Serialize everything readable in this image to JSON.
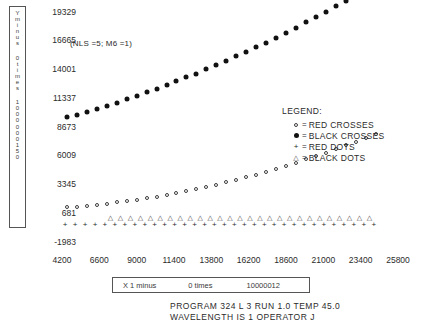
{
  "chart_data": {
    "type": "scatter",
    "title": "",
    "annotation": "(NLS =5; M6 =1)",
    "xlabel": "X 1 minus     0 times     10000012",
    "ylabel": "Y minus 0 times 1000000150",
    "xlim": [
      4200,
      25800
    ],
    "ylim": [
      -1983,
      19329
    ],
    "grid": false,
    "legend_position": "right-middle",
    "xticks": [
      4200,
      6600,
      9000,
      11400,
      13800,
      16200,
      18600,
      21000,
      23400,
      25800
    ],
    "yticks": [
      19329,
      16665,
      14001,
      11337,
      8673,
      6009,
      3345,
      681,
      -1983
    ],
    "series": [
      {
        "name": "BLACK CROSSES",
        "marker": "filled-circle",
        "color": "#111111",
        "x": [
          4520,
          5160,
          5800,
          6440,
          7080,
          7720,
          8360,
          9000,
          9640,
          10280,
          10920,
          11560,
          12200,
          12840,
          13480,
          14120,
          14760,
          15400,
          16040,
          16680,
          17320,
          17960,
          18600,
          19240,
          19880,
          20520,
          21160,
          21800,
          22440,
          23080,
          23720,
          24360
        ],
        "y": [
          9560,
          9820,
          10090,
          10360,
          10650,
          10940,
          11240,
          11560,
          11880,
          12210,
          12550,
          12900,
          13260,
          13630,
          14010,
          14400,
          14800,
          15210,
          15630,
          16060,
          16500,
          16950,
          17410,
          17880,
          18360,
          18850,
          19350,
          19860,
          20380,
          20910,
          21450,
          22000
        ]
      },
      {
        "name": "RED CROSSES",
        "marker": "open-circle",
        "color": "#3d3d3d",
        "x": [
          4520,
          5160,
          5800,
          6440,
          7080,
          7720,
          8360,
          9000,
          9640,
          10280,
          10920,
          11560,
          12200,
          12840,
          13480,
          14120,
          14760,
          15400,
          16040,
          16680,
          17320,
          17960,
          18600,
          19240,
          19880,
          20520,
          21160,
          21800,
          22440,
          23080,
          23720,
          24360
        ],
        "y": [
          1230,
          1300,
          1380,
          1470,
          1570,
          1680,
          1800,
          1930,
          2070,
          2220,
          2380,
          2550,
          2730,
          2920,
          3120,
          3330,
          3550,
          3780,
          4020,
          4270,
          4530,
          4800,
          5080,
          5370,
          5670,
          5980,
          6300,
          6630,
          6970,
          7320,
          7680,
          8050
        ]
      },
      {
        "name": "RED DOTS",
        "marker": "plus",
        "color": "#2b2b2b",
        "x": [
          4400,
          5040,
          5680,
          6320,
          6960,
          7600,
          8240,
          8880,
          9520,
          10160,
          10800,
          11440,
          12080,
          12720,
          13360,
          14000,
          14640,
          15280,
          15920,
          16560,
          17200,
          17840,
          18480,
          19120,
          19760,
          20400,
          21040,
          21680,
          22320,
          22960,
          23600,
          24240
        ],
        "y": [
          -430,
          -430,
          -430,
          -430,
          -430,
          -430,
          -430,
          -430,
          -430,
          -430,
          -430,
          -430,
          -430,
          -430,
          -430,
          -430,
          -430,
          -430,
          -430,
          -430,
          -430,
          -430,
          -430,
          -430,
          -430,
          -430,
          -430,
          -430,
          -430,
          -430,
          -430,
          -430
        ]
      },
      {
        "name": "BLACK DOTS",
        "marker": "triangle",
        "color": "#3d3d3d",
        "x": [
          7320,
          7960,
          8600,
          9240,
          9880,
          10520,
          11160,
          11800,
          12440,
          13080,
          13720,
          14360,
          15000,
          15640,
          16280,
          16920,
          17560,
          18200,
          18840,
          19480,
          20120,
          20760,
          21400,
          22040,
          22680,
          23320,
          23960
        ],
        "y": [
          280,
          280,
          280,
          280,
          280,
          280,
          280,
          280,
          280,
          280,
          280,
          280,
          280,
          280,
          280,
          280,
          280,
          280,
          280,
          280,
          280,
          280,
          280,
          280,
          280,
          280,
          280
        ]
      }
    ]
  },
  "y_caption": {
    "line1": "Y\nm\ni\nn\nu\ns",
    "line2": "0\nt\ni\nm\ne\ns",
    "line3": "1\n0\n0\n0\n0\n0\n0\n1\n5\n0"
  },
  "x_caption": {
    "part1": "X 1 minus",
    "part2": "0 times",
    "part3": "10000012"
  },
  "legend": {
    "title": "LEGEND:",
    "equals": "=",
    "items": [
      {
        "symbol": "open-circle",
        "label": "RED CROSSES"
      },
      {
        "symbol": "filled-circle",
        "label": "BLACK CROSSES"
      },
      {
        "symbol": "plus",
        "label": "RED DOTS"
      },
      {
        "symbol": "triangle",
        "label": "BLACK DOTS"
      }
    ]
  },
  "footer": {
    "line1": "PROGRAM 324 L 3 RUN 1.0  TEMP 45.0",
    "line2": "WAVELENGTH IS 1  OPERATOR   J"
  }
}
